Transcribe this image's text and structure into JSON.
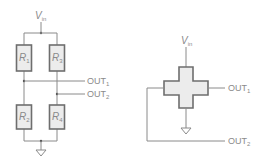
{
  "diagram": {
    "left_circuit": {
      "title": "Wheatstone bridge",
      "supply_label": {
        "main": "V",
        "sub": "in"
      },
      "resistors": [
        {
          "id": "R1",
          "main": "R",
          "sub": "1"
        },
        {
          "id": "R3",
          "main": "R",
          "sub": "3"
        },
        {
          "id": "R2",
          "main": "R",
          "sub": "2"
        },
        {
          "id": "R4",
          "main": "R",
          "sub": "4"
        }
      ],
      "outputs": [
        {
          "main": "OUT",
          "sub": "1"
        },
        {
          "main": "OUT",
          "sub": "2"
        }
      ],
      "ground": "ground-symbol"
    },
    "right_circuit": {
      "title": "Cross-shaped sensor",
      "supply_label": {
        "main": "V",
        "sub": "in"
      },
      "outputs": [
        {
          "main": "OUT",
          "sub": "1"
        },
        {
          "main": "OUT",
          "sub": "2"
        }
      ],
      "ground": "ground-symbol"
    },
    "colors": {
      "wire": "#8a8a8a",
      "box_fill": "#ececec",
      "box_stroke": "#6e6e6e",
      "text": "#8a8a8a"
    }
  }
}
